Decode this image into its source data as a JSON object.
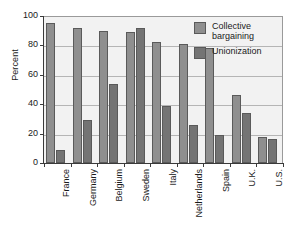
{
  "chart_data": {
    "type": "bar",
    "title": "",
    "xlabel": "",
    "ylabel": "Percent",
    "ylim": [
      0,
      100
    ],
    "yticks": [
      0,
      20,
      40,
      60,
      80,
      100
    ],
    "grid": true,
    "legend_position": "top-right",
    "categories": [
      "France",
      "Germany",
      "Belgium",
      "Sweden",
      "Italy",
      "Netherlands",
      "Spain",
      "U.K.",
      "U.S."
    ],
    "series": [
      {
        "name": "Collective bargaining",
        "color": "#8f8f8f",
        "values": [
          95,
          92,
          90,
          89,
          82,
          81,
          78,
          46,
          18
        ]
      },
      {
        "name": "Unionization",
        "color": "#747474",
        "values": [
          9,
          29,
          54,
          92,
          39,
          26,
          19,
          34,
          16
        ]
      }
    ]
  },
  "legend": {
    "items": [
      {
        "label": "Collective\nbargaining",
        "key": "collective-bargaining"
      },
      {
        "label": "Unionization",
        "key": "unionization"
      }
    ]
  },
  "axis": {
    "y_title": "Percent",
    "y_tick_labels": [
      "100",
      "80",
      "60",
      "40",
      "20",
      "0"
    ]
  },
  "colors": {
    "collective_bargaining": "#8f8f8f",
    "unionization": "#747474",
    "plot_background": "#f2f2f2",
    "gridline": "#b5b5b5",
    "axis": "#3a3a3a",
    "text": "#1a1a1a"
  }
}
